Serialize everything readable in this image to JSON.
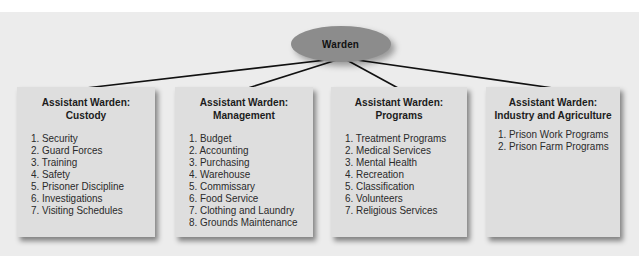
{
  "diagram": {
    "root": {
      "label": "Warden"
    },
    "children": [
      {
        "title_line1": "Assistant Warden:",
        "title_line2": "Custody",
        "items": [
          "1. Security",
          "2. Guard Forces",
          "3. Training",
          "4. Safety",
          "5. Prisoner Discipline",
          "6. Investigations",
          "7. Visiting Schedules"
        ]
      },
      {
        "title_line1": "Assistant Warden:",
        "title_line2": "Management",
        "items": [
          "1. Budget",
          "2. Accounting",
          "3. Purchasing",
          "4. Warehouse",
          "5. Commissary",
          "6. Food Service",
          "7. Clothing and Laundry",
          "8. Grounds Maintenance"
        ]
      },
      {
        "title_line1": "Assistant Warden:",
        "title_line2": "Programs",
        "items": [
          "1. Treatment Programs",
          "2. Medical Services",
          "3. Mental Health",
          "4. Recreation",
          "5. Classification",
          "6. Volunteers",
          "7. Religious Services"
        ]
      },
      {
        "title_line1": "Assistant Warden:",
        "title_line2": "Industry and Agriculture",
        "items": [
          "1. Prison Work Programs",
          "2. Prison Farm Programs"
        ]
      }
    ]
  },
  "colors": {
    "panel": "#ececec",
    "box": "#dedede",
    "oval": "#8c8c8c",
    "line": "#111111"
  }
}
